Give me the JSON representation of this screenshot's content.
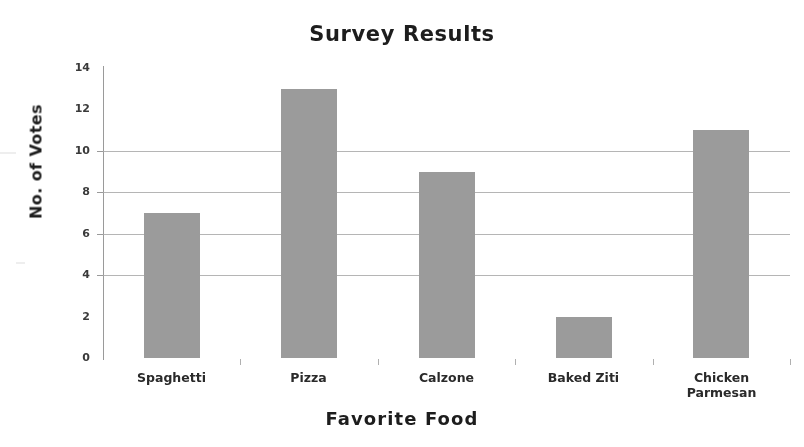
{
  "chart_data": {
    "type": "bar",
    "title": "Survey Results",
    "xlabel": "Favorite  Food",
    "ylabel": "No. of Votes",
    "categories": [
      "Spaghetti",
      "Pizza",
      "Calzone",
      "Baked Ziti",
      "Chicken Parmesan"
    ],
    "category_lines": [
      [
        "Spaghetti"
      ],
      [
        "Pizza"
      ],
      [
        "Calzone"
      ],
      [
        "Baked Ziti"
      ],
      [
        "Chicken",
        "Parmesan"
      ]
    ],
    "values": [
      7,
      13,
      9,
      2,
      11
    ],
    "ylim": [
      0,
      14
    ],
    "ytick_step": 2,
    "yticks": [
      0,
      2,
      4,
      6,
      8,
      10,
      12,
      14
    ],
    "ytick_labels": [
      "0",
      "2",
      "4",
      "6",
      "8",
      "10",
      "12",
      "14"
    ],
    "gridlines": [
      4,
      6,
      8,
      10
    ],
    "grid": true,
    "legend": null,
    "bar_color": "#9b9b9b",
    "grid_color": "#a8a8a8",
    "axis_color": "#9a9a9a",
    "text_color": "#1d1d1d"
  }
}
